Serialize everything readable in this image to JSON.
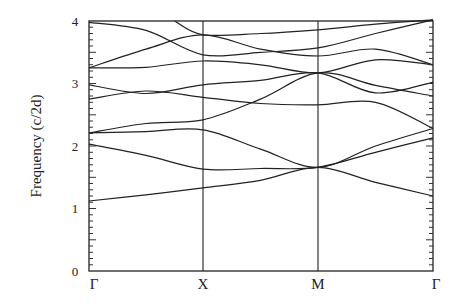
{
  "chart_data": {
    "type": "line",
    "title": "",
    "xlabel": "",
    "ylabel": "Frequency (c/2d)",
    "ylim": [
      0,
      4
    ],
    "yticks": [
      "0",
      "1",
      "2",
      "3",
      "4"
    ],
    "x_ticks": [
      "Γ",
      "X",
      "M",
      "Γ"
    ],
    "grid": false,
    "legend": null,
    "frame_px": {
      "left": 89,
      "right": 433,
      "top": 21,
      "bottom": 271
    },
    "kpoint_px": [
      89,
      203,
      318,
      433
    ],
    "series": [
      {
        "name": "band1",
        "points": [
          [
            0,
            1.12
          ],
          [
            0.5,
            1.22
          ],
          [
            1,
            1.33
          ],
          [
            1.5,
            1.45
          ],
          [
            2,
            1.66
          ],
          [
            2.5,
            1.42
          ],
          [
            3,
            1.2
          ]
        ]
      },
      {
        "name": "band2",
        "points": [
          [
            0,
            2.03
          ],
          [
            0.5,
            1.85
          ],
          [
            1,
            1.63
          ],
          [
            1.5,
            1.64
          ],
          [
            2,
            1.66
          ],
          [
            2.5,
            1.9
          ],
          [
            3,
            2.13
          ]
        ]
      },
      {
        "name": "band3",
        "points": [
          [
            0,
            2.21
          ],
          [
            0.5,
            2.23
          ],
          [
            1,
            2.26
          ],
          [
            1.5,
            1.95
          ],
          [
            2,
            1.66
          ],
          [
            2.5,
            2.0
          ],
          [
            3,
            2.28
          ]
        ]
      },
      {
        "name": "band4",
        "points": [
          [
            0,
            2.21
          ],
          [
            0.5,
            2.36
          ],
          [
            1,
            2.42
          ],
          [
            1.5,
            2.75
          ],
          [
            2,
            3.17
          ],
          [
            2.5,
            2.97
          ],
          [
            3,
            2.8
          ]
        ]
      },
      {
        "name": "band5",
        "points": [
          [
            0,
            2.75
          ],
          [
            0.5,
            2.88
          ],
          [
            1,
            2.78
          ],
          [
            1.5,
            2.68
          ],
          [
            2,
            2.66
          ],
          [
            2.5,
            2.7
          ],
          [
            3,
            2.28
          ]
        ]
      },
      {
        "name": "band6",
        "points": [
          [
            0,
            2.98
          ],
          [
            0.5,
            2.84
          ],
          [
            1,
            2.98
          ],
          [
            1.5,
            3.05
          ],
          [
            2,
            3.17
          ],
          [
            2.5,
            2.85
          ],
          [
            3,
            3.02
          ]
        ]
      },
      {
        "name": "band7",
        "points": [
          [
            0,
            3.25
          ],
          [
            0.5,
            3.26
          ],
          [
            1,
            3.36
          ],
          [
            1.5,
            3.3
          ],
          [
            2,
            3.17
          ],
          [
            2.5,
            3.38
          ],
          [
            3,
            3.3
          ]
        ]
      },
      {
        "name": "band8",
        "points": [
          [
            0,
            3.25
          ],
          [
            0.5,
            3.55
          ],
          [
            1,
            3.78
          ],
          [
            1.5,
            3.55
          ],
          [
            2,
            3.44
          ],
          [
            2.5,
            3.55
          ],
          [
            3,
            3.3
          ]
        ]
      },
      {
        "name": "band9",
        "points": [
          [
            0,
            3.98
          ],
          [
            0.5,
            3.85
          ],
          [
            1,
            3.46
          ],
          [
            1.5,
            3.5
          ],
          [
            2,
            3.57
          ],
          [
            2.5,
            3.8
          ],
          [
            3,
            4.02
          ]
        ]
      },
      {
        "name": "band10",
        "points": [
          [
            0.75,
            4.0
          ],
          [
            1,
            3.78
          ],
          [
            1.5,
            3.8
          ],
          [
            2,
            3.86
          ],
          [
            2.5,
            3.95
          ],
          [
            3,
            4.02
          ]
        ]
      }
    ]
  }
}
